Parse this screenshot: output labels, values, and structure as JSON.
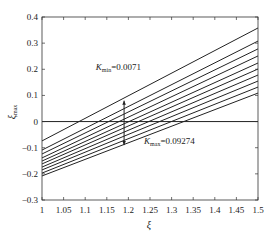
{
  "chart_data": {
    "type": "line",
    "title": "",
    "xlabel": "ξ",
    "ylabel": "ξmax",
    "ylabel_main": "ξ",
    "ylabel_sub": "max",
    "xlim": [
      1,
      1.5
    ],
    "ylim": [
      -0.3,
      0.4
    ],
    "grid": false,
    "legend": "none",
    "x_ticks": [
      1,
      1.05,
      1.1,
      1.15,
      1.2,
      1.25,
      1.3,
      1.35,
      1.4,
      1.45,
      1.5
    ],
    "x_tick_labels": [
      "1",
      "1.05",
      "1.1",
      "1.15",
      "1.2",
      "1.25",
      "1.3",
      "1.35",
      "1.4",
      "1.45",
      "1.5"
    ],
    "y_ticks": [
      0.4,
      0.3,
      0.2,
      0.1,
      0,
      -0.1,
      -0.2,
      -0.3
    ],
    "y_tick_labels": [
      "0.4",
      "0.3",
      "0.2",
      "0.1",
      "0",
      "−0.1",
      "−0.2",
      "−0.3"
    ],
    "x": [
      1,
      1.5
    ],
    "series": [
      {
        "name": "K=0.0071",
        "values": [
          -0.074,
          0.358
        ]
      },
      {
        "name": "K2",
        "values": [
          -0.109,
          0.308
        ]
      },
      {
        "name": "K3",
        "values": [
          -0.124,
          0.278
        ]
      },
      {
        "name": "K4",
        "values": [
          -0.139,
          0.251
        ]
      },
      {
        "name": "K5",
        "values": [
          -0.151,
          0.224
        ]
      },
      {
        "name": "K6",
        "values": [
          -0.162,
          0.201
        ]
      },
      {
        "name": "K7",
        "values": [
          -0.174,
          0.178
        ]
      },
      {
        "name": "K8",
        "values": [
          -0.185,
          0.155
        ]
      },
      {
        "name": "K9",
        "values": [
          -0.197,
          0.132
        ]
      },
      {
        "name": "K=0.09274",
        "values": [
          -0.208,
          0.109
        ]
      }
    ],
    "reference_line": {
      "y": 0
    },
    "arrow": {
      "x": 1.19,
      "y_from": 0.08,
      "y_to": -0.09
    },
    "annotations": [
      {
        "text_main": "K",
        "text_sub": "min",
        "text_value": "=0.0071",
        "x": 1.157,
        "y": 0.2
      },
      {
        "text_main": "K",
        "text_sub": "max",
        "text_value": "=0.09274",
        "x": 1.278,
        "y": -0.076
      }
    ],
    "line_color": "#222222"
  }
}
